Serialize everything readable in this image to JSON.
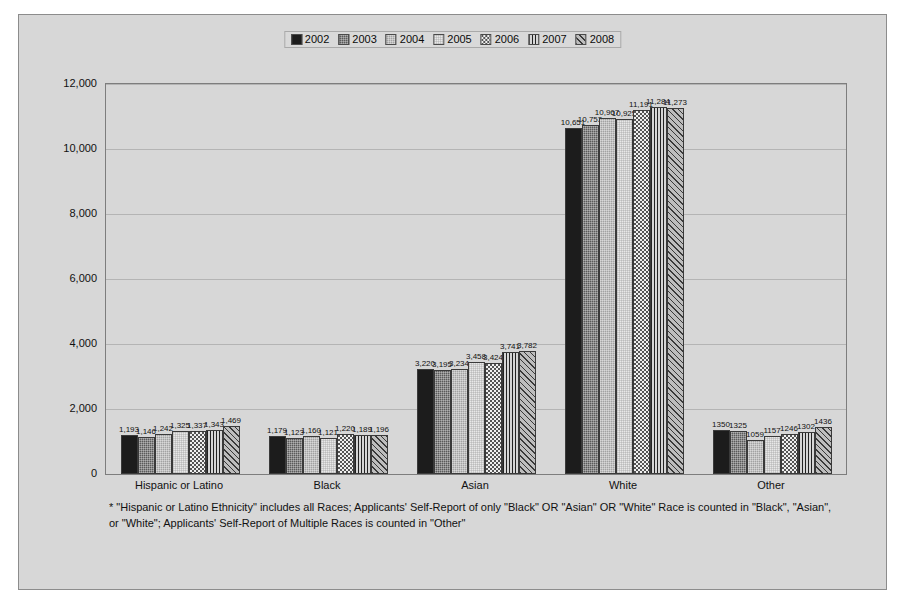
{
  "chart_data": {
    "type": "bar",
    "title": "",
    "subtitle": "",
    "xlabel": "",
    "ylabel": "",
    "ylim": [
      0,
      12000
    ],
    "yticks": [
      "0",
      "2,000",
      "4,000",
      "6,000",
      "8,000",
      "10,000",
      "12,000"
    ],
    "ytick_values": [
      0,
      2000,
      4000,
      6000,
      8000,
      10000,
      12000
    ],
    "grid": true,
    "legend_position": "top-center",
    "categories": [
      "Hispanic or Latino",
      "Black",
      "Asian",
      "White",
      "Other"
    ],
    "series": [
      {
        "name": "2002",
        "pattern": "solid-black",
        "values": [
          1193,
          1179,
          3220,
          10651,
          1350
        ],
        "labels": [
          "1,193",
          "1,179",
          "3,220",
          "10,651",
          "1350"
        ]
      },
      {
        "name": "2003",
        "pattern": "dark-gray-fine-texture",
        "values": [
          1146,
          1123,
          3195,
          10753,
          1325
        ],
        "labels": [
          "1,146",
          "1,123",
          "3,195",
          "10,753",
          "1325"
        ]
      },
      {
        "name": "2004",
        "pattern": "medium-gray-fine-texture",
        "values": [
          1242,
          1160,
          3234,
          10967,
          1059
        ],
        "labels": [
          "1,242",
          "1,160",
          "3,234",
          "10,967",
          "1059"
        ]
      },
      {
        "name": "2005",
        "pattern": "light-gray-fine-texture",
        "values": [
          1325,
          1121,
          3458,
          10925,
          1157
        ],
        "labels": [
          "1,325",
          "1,121",
          "3,458",
          "10,925",
          "1157"
        ]
      },
      {
        "name": "2006",
        "pattern": "white-dotted",
        "values": [
          1337,
          1220,
          3424,
          11191,
          1246
        ],
        "labels": [
          "1,337",
          "1,220",
          "3,424",
          "11,191",
          "1246"
        ]
      },
      {
        "name": "2007",
        "pattern": "vertical-stripes",
        "values": [
          1343,
          1189,
          3741,
          11284,
          1302
        ],
        "labels": [
          "1,343",
          "1,189",
          "3,741",
          "11,284",
          "1302"
        ]
      },
      {
        "name": "2008",
        "pattern": "diagonal-hatch",
        "values": [
          1469,
          1196,
          3782,
          11273,
          1436
        ],
        "labels": [
          "1,469",
          "1,196",
          "3,782",
          "11,273",
          "1436"
        ]
      }
    ],
    "annotations": [
      "* \"Hispanic or Latino Ethnicity\" includes all Races; Applicants' Self-Report of only \"Black\" OR \"Asian\" OR \"White\" Race is counted in \"Black\", \"Asian\", or \"White\"; Applicants' Self-Report of Multiple Races is counted in \"Other\""
    ]
  },
  "footnote": {
    "text": "* \"Hispanic or Latino Ethnicity\" includes all Races; Applicants' Self-Report of only \"Black\" OR \"Asian\" OR \"White\" Race is counted in \"Black\", \"Asian\", or \"White\"; Applicants' Self-Report of Multiple Races is counted in \"Other\""
  },
  "colors": {
    "chart_background": "#d7d7d7",
    "plot_background": "#d7d7d7",
    "gridline": "#b4b4b4",
    "border": "#8c8c8c",
    "text": "#111111"
  }
}
